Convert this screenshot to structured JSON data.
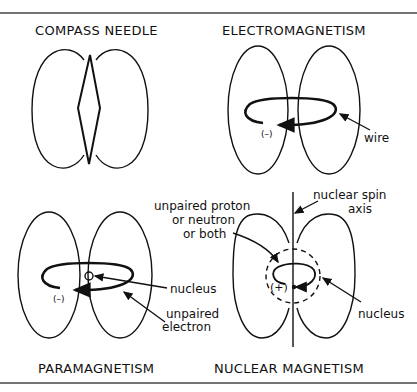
{
  "panels": {
    "compass": {
      "title": "COMPASS NEEDLE"
    },
    "electro": {
      "title": "ELECTROMAGNETISM",
      "charge": "(–)",
      "wire_label": "wire"
    },
    "para": {
      "title": "PARAMAGNETISM",
      "charge": "(–)",
      "nucleus_label": "nucleus",
      "electron_label_1": "unpaired",
      "electron_label_2": "electron"
    },
    "nuclear": {
      "title": "NUCLEAR  MAGNETISM",
      "charge": "(+)",
      "spin_label_1": "nuclear  spin",
      "spin_label_2": "axis",
      "nucleon_label_1": "unpaired proton",
      "nucleon_label_2": "or neutron",
      "nucleon_label_3": "or both",
      "nucleus_label": "nucleus"
    }
  },
  "colors": {
    "ink": "#111111",
    "rule": "#444444",
    "background": "#ffffff"
  }
}
